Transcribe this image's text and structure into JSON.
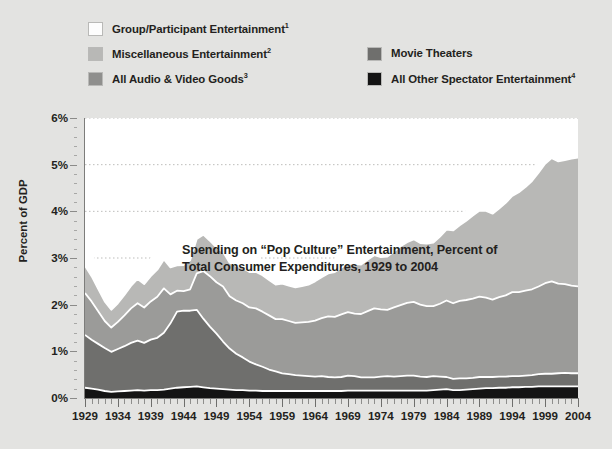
{
  "chart_data": {
    "type": "area",
    "stacked": true,
    "title_lines": [
      "Spending on “Pop Culture” Entertainment, Percent of",
      "Total Consumer Expenditures, 1929 to 2004"
    ],
    "xlabel": "",
    "ylabel": "Percent of GDP",
    "ylim": [
      0,
      6
    ],
    "xlim": [
      1929,
      2004
    ],
    "y_tick_labels": [
      "0%",
      "1%",
      "2%",
      "3%",
      "4%",
      "5%",
      "6%"
    ],
    "y_tick_values": [
      0,
      1,
      2,
      3,
      4,
      5,
      6
    ],
    "x_tick_labels": [
      "1929",
      "1934",
      "1939",
      "1944",
      "1949",
      "1954",
      "1959",
      "1964",
      "1969",
      "1974",
      "1979",
      "1984",
      "1989",
      "1994",
      "1999",
      "2004"
    ],
    "x_tick_values": [
      1929,
      1934,
      1939,
      1944,
      1949,
      1954,
      1959,
      1964,
      1969,
      1974,
      1979,
      1984,
      1989,
      1994,
      1999,
      2004
    ],
    "x_minor_tick_step": 1,
    "grid": "horizontal-dotted",
    "legend_position": "above-plot",
    "x": [
      1929,
      1930,
      1931,
      1932,
      1933,
      1934,
      1935,
      1936,
      1937,
      1938,
      1939,
      1940,
      1941,
      1942,
      1943,
      1944,
      1945,
      1946,
      1947,
      1948,
      1949,
      1950,
      1951,
      1952,
      1953,
      1954,
      1955,
      1956,
      1957,
      1958,
      1959,
      1960,
      1961,
      1962,
      1963,
      1964,
      1965,
      1966,
      1967,
      1968,
      1969,
      1970,
      1971,
      1972,
      1973,
      1974,
      1975,
      1976,
      1977,
      1978,
      1979,
      1980,
      1981,
      1982,
      1983,
      1984,
      1985,
      1986,
      1987,
      1988,
      1989,
      1990,
      1991,
      1992,
      1993,
      1994,
      1995,
      1996,
      1997,
      1998,
      1999,
      2000,
      2001,
      2002,
      2003,
      2004
    ],
    "series": [
      {
        "name": "All Other Spectator Entertainment",
        "footnote": "4",
        "color": "#141414",
        "stack_order": 1,
        "values": [
          0.22,
          0.2,
          0.18,
          0.15,
          0.13,
          0.14,
          0.15,
          0.16,
          0.17,
          0.16,
          0.17,
          0.17,
          0.18,
          0.2,
          0.22,
          0.23,
          0.24,
          0.25,
          0.23,
          0.21,
          0.2,
          0.19,
          0.18,
          0.17,
          0.17,
          0.16,
          0.16,
          0.15,
          0.15,
          0.15,
          0.15,
          0.15,
          0.15,
          0.15,
          0.15,
          0.15,
          0.15,
          0.15,
          0.15,
          0.15,
          0.16,
          0.16,
          0.16,
          0.16,
          0.16,
          0.16,
          0.16,
          0.16,
          0.16,
          0.16,
          0.16,
          0.16,
          0.16,
          0.17,
          0.18,
          0.19,
          0.17,
          0.17,
          0.18,
          0.19,
          0.2,
          0.21,
          0.21,
          0.22,
          0.22,
          0.23,
          0.23,
          0.24,
          0.24,
          0.25,
          0.25,
          0.25,
          0.25,
          0.25,
          0.25,
          0.25
        ]
      },
      {
        "name": "Movie Theaters",
        "footnote": "",
        "color": "#6f6f6d",
        "stack_order": 2,
        "values": [
          1.13,
          1.05,
          0.98,
          0.92,
          0.86,
          0.91,
          0.96,
          1.02,
          1.06,
          1.02,
          1.08,
          1.12,
          1.22,
          1.4,
          1.63,
          1.64,
          1.63,
          1.64,
          1.47,
          1.32,
          1.18,
          1.02,
          0.88,
          0.78,
          0.7,
          0.62,
          0.56,
          0.52,
          0.46,
          0.42,
          0.38,
          0.36,
          0.34,
          0.33,
          0.32,
          0.31,
          0.32,
          0.3,
          0.29,
          0.3,
          0.32,
          0.31,
          0.28,
          0.28,
          0.28,
          0.3,
          0.31,
          0.3,
          0.31,
          0.32,
          0.32,
          0.3,
          0.29,
          0.3,
          0.28,
          0.26,
          0.24,
          0.25,
          0.24,
          0.24,
          0.25,
          0.24,
          0.24,
          0.24,
          0.24,
          0.24,
          0.24,
          0.24,
          0.25,
          0.26,
          0.27,
          0.27,
          0.28,
          0.29,
          0.28,
          0.28
        ]
      },
      {
        "name": "All Audio & Video Goods",
        "footnote": "3",
        "color": "#9b9b99",
        "stack_order": 3,
        "values": [
          0.9,
          0.82,
          0.7,
          0.58,
          0.52,
          0.58,
          0.66,
          0.74,
          0.8,
          0.76,
          0.82,
          0.88,
          0.95,
          0.62,
          0.45,
          0.42,
          0.46,
          0.78,
          1.02,
          1.08,
          1.1,
          1.18,
          1.12,
          1.14,
          1.16,
          1.16,
          1.2,
          1.18,
          1.16,
          1.12,
          1.16,
          1.14,
          1.12,
          1.14,
          1.16,
          1.2,
          1.24,
          1.3,
          1.3,
          1.34,
          1.36,
          1.34,
          1.36,
          1.42,
          1.48,
          1.44,
          1.42,
          1.48,
          1.52,
          1.56,
          1.58,
          1.54,
          1.52,
          1.5,
          1.56,
          1.64,
          1.62,
          1.66,
          1.68,
          1.7,
          1.72,
          1.7,
          1.66,
          1.7,
          1.74,
          1.8,
          1.8,
          1.82,
          1.84,
          1.88,
          1.94,
          1.98,
          1.92,
          1.9,
          1.88,
          1.86
        ]
      },
      {
        "name": "Miscellaneous Entertainment",
        "footnote": "2",
        "color": "#b8b8b6",
        "stack_order": 4,
        "values": [
          0.58,
          0.54,
          0.48,
          0.42,
          0.38,
          0.4,
          0.44,
          0.48,
          0.52,
          0.5,
          0.54,
          0.58,
          0.62,
          0.58,
          0.54,
          0.56,
          0.62,
          0.74,
          0.78,
          0.76,
          0.74,
          0.74,
          0.72,
          0.74,
          0.76,
          0.76,
          0.78,
          0.78,
          0.76,
          0.74,
          0.76,
          0.76,
          0.76,
          0.78,
          0.8,
          0.84,
          0.88,
          0.92,
          0.96,
          1.0,
          1.04,
          1.06,
          1.06,
          1.1,
          1.14,
          1.12,
          1.14,
          1.2,
          1.26,
          1.3,
          1.34,
          1.32,
          1.34,
          1.36,
          1.44,
          1.52,
          1.56,
          1.62,
          1.7,
          1.78,
          1.84,
          1.86,
          1.84,
          1.9,
          1.98,
          2.06,
          2.14,
          2.22,
          2.32,
          2.44,
          2.56,
          2.64,
          2.62,
          2.66,
          2.72,
          2.76
        ]
      },
      {
        "name": "Group/Participant Entertainment",
        "footnote": "1",
        "color": "#ffffff",
        "stack_order": 5,
        "values": [
          0.57,
          0.5,
          0.42,
          0.34,
          0.3,
          0.32,
          0.34,
          0.36,
          0.38,
          0.36,
          0.38,
          0.4,
          0.42,
          0.38,
          0.34,
          0.34,
          0.36,
          0.42,
          0.44,
          0.42,
          0.4,
          0.38,
          0.36,
          0.36,
          0.36,
          0.34,
          0.34,
          0.32,
          0.32,
          0.3,
          0.3,
          0.28,
          0.28,
          0.28,
          0.28,
          0.28,
          0.28,
          0.28,
          0.28,
          0.28,
          0.28,
          0.28,
          0.26,
          0.26,
          0.26,
          0.26,
          0.26,
          0.26,
          0.26,
          0.26,
          0.26,
          0.24,
          0.24,
          0.24,
          0.24,
          0.24,
          0.22,
          0.22,
          0.22,
          0.22,
          0.22,
          0.22,
          0.2,
          0.2,
          0.2,
          0.2,
          0.2,
          0.2,
          0.2,
          0.2,
          0.2,
          0.2,
          0.2,
          0.2,
          0.2,
          0.2
        ]
      }
    ]
  },
  "legend": {
    "left_column": [
      {
        "label": "Group/Participant Entertainment",
        "sup": "1",
        "color": "#fdfdfd"
      },
      {
        "label": "Miscellaneous Entertainment",
        "sup": "2",
        "color": "#b8b8b6"
      },
      {
        "label": "All Audio & Video Goods",
        "sup": "3",
        "color": "#8f8f8d"
      }
    ],
    "right_column": [
      {
        "label": "Movie Theaters",
        "sup": "",
        "color": "#6f6f6d"
      },
      {
        "label": "All Other Spectator Entertainment",
        "sup": "4",
        "color": "#141414"
      }
    ]
  },
  "colors": {
    "page_background": "#e3e3e1",
    "plot_background": "#ffffff",
    "axis": "#7d7d7b",
    "text": "#231f20",
    "gridline": "#bdbdbb",
    "series_outline": "#ffffff"
  }
}
